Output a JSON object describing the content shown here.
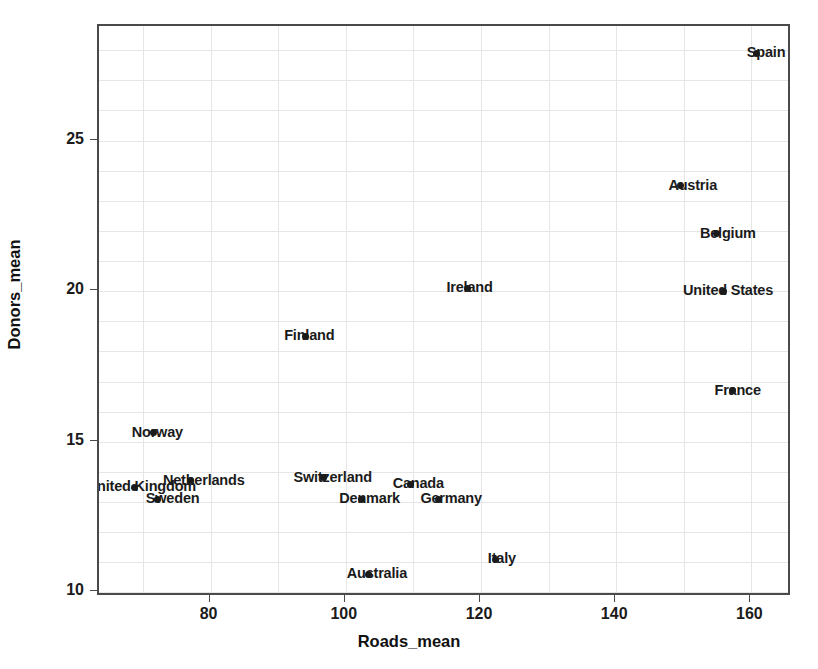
{
  "chart_data": {
    "type": "scatter",
    "title": "",
    "xlabel": "Roads_mean",
    "ylabel": "Donors_mean",
    "xlim": [
      63.5,
      166
    ],
    "ylim": [
      9.85,
      28.8
    ],
    "xticks": [
      80,
      100,
      120,
      140,
      160
    ],
    "xticklabels": [
      "80",
      "100",
      "120",
      "140",
      "160"
    ],
    "yticks": [
      10,
      15,
      20,
      25
    ],
    "yticklabels": [
      "10",
      "15",
      "20",
      "25"
    ],
    "grid": true,
    "grid_x_step": 10,
    "grid_y_step": 1,
    "legend": "none",
    "marker_color": "#1b1b1b",
    "grid_color": "#e6e6e6",
    "frame_color": "#4a4a4a",
    "points": [
      {
        "label": "Spain",
        "x": 160.8,
        "y": 27.9
      },
      {
        "label": "Austria",
        "x": 149.5,
        "y": 23.5
      },
      {
        "label": "Belgium",
        "x": 154.9,
        "y": 21.9
      },
      {
        "label": "United States",
        "x": 155.8,
        "y": 20.0
      },
      {
        "label": "Ireland",
        "x": 118.0,
        "y": 20.1
      },
      {
        "label": "Finland",
        "x": 94.0,
        "y": 18.5
      },
      {
        "label": "France",
        "x": 157.2,
        "y": 16.7
      },
      {
        "label": "Norway",
        "x": 71.6,
        "y": 15.3
      },
      {
        "label": "Switzerland",
        "x": 96.7,
        "y": 13.8
      },
      {
        "label": "Canada",
        "x": 109.6,
        "y": 13.6
      },
      {
        "label": "Netherlands",
        "x": 77.1,
        "y": 13.7
      },
      {
        "label": "United Kingdom",
        "x": 68.8,
        "y": 13.5
      },
      {
        "label": "Sweden",
        "x": 72.2,
        "y": 13.1
      },
      {
        "label": "Denmark",
        "x": 102.3,
        "y": 13.1
      },
      {
        "label": "Germany",
        "x": 113.7,
        "y": 13.1
      },
      {
        "label": "Italy",
        "x": 122.2,
        "y": 11.1
      },
      {
        "label": "Australia",
        "x": 103.4,
        "y": 10.6
      }
    ],
    "label_offsets": [
      {
        "label": "Spain",
        "dx": -10,
        "dy": -9,
        "anchor": "start"
      },
      {
        "label": "Austria",
        "dx": -12,
        "dy": -9,
        "anchor": "start"
      },
      {
        "label": "Belgium",
        "dx": -17,
        "dy": -9,
        "anchor": "start"
      },
      {
        "label": "United States",
        "dx": -40,
        "dy": -9,
        "anchor": "start"
      },
      {
        "label": "Ireland",
        "dx": -21,
        "dy": -9,
        "anchor": "start"
      },
      {
        "label": "Finland",
        "dx": -21,
        "dy": -9,
        "anchor": "start"
      },
      {
        "label": "France",
        "dx": -18,
        "dy": -9,
        "anchor": "start"
      },
      {
        "label": "Norway",
        "dx": -22,
        "dy": -9,
        "anchor": "start"
      },
      {
        "label": "Switzerland",
        "dx": -30,
        "dy": -9,
        "anchor": "start"
      },
      {
        "label": "Canada",
        "dx": -18,
        "dy": -9,
        "anchor": "start"
      },
      {
        "label": "Netherlands",
        "dx": -28,
        "dy": -9,
        "anchor": "start"
      },
      {
        "label": "United Kingdom",
        "dx": -48,
        "dy": -9,
        "anchor": "start"
      },
      {
        "label": "Sweden",
        "dx": -12,
        "dy": -9,
        "anchor": "start"
      },
      {
        "label": "Denmark",
        "dx": -22,
        "dy": -9,
        "anchor": "start"
      },
      {
        "label": "Germany",
        "dx": -18,
        "dy": -9,
        "anchor": "start"
      },
      {
        "label": "Italy",
        "dx": -8,
        "dy": -9,
        "anchor": "start"
      },
      {
        "label": "Australia",
        "dx": -22,
        "dy": -9,
        "anchor": "start"
      }
    ]
  }
}
